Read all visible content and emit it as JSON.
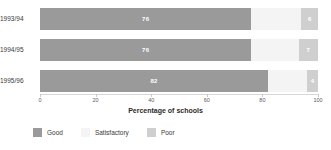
{
  "chart_data": {
    "type": "bar",
    "orientation": "horizontal",
    "stacked": true,
    "title": "",
    "xlabel": "Percentage of schools",
    "ylabel": "",
    "xlim": [
      0,
      100
    ],
    "grid": false,
    "legend_position": "bottom-left",
    "categories": [
      "1993/94",
      "1994/95",
      "1995/96"
    ],
    "tick_labels": [
      "0",
      "20",
      "40",
      "60",
      "80",
      "100"
    ],
    "tick_values": [
      0,
      20,
      40,
      60,
      80,
      100
    ],
    "series": [
      {
        "name": "Good",
        "color": "#9a9a9a",
        "values": [
          76,
          76,
          82
        ],
        "labels": [
          "76",
          "76",
          "82"
        ]
      },
      {
        "name": "Satisfactory",
        "color": "#f4f4f4",
        "values": [
          18,
          17,
          14
        ],
        "labels": [
          "",
          "",
          ""
        ]
      },
      {
        "name": "Poor",
        "color": "#cfcfcf",
        "values": [
          6,
          7,
          4
        ],
        "labels": [
          "6",
          "7",
          "4"
        ]
      }
    ]
  },
  "legend": {
    "items": [
      {
        "label": "Good"
      },
      {
        "label": "Satisfactory"
      },
      {
        "label": "Poor"
      }
    ]
  }
}
